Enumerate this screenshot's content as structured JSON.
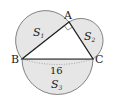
{
  "diagram": {
    "points": {
      "A": {
        "label": "A",
        "x": 69,
        "y": 22
      },
      "B": {
        "label": "B",
        "x": 22,
        "y": 59
      },
      "C": {
        "label": "C",
        "x": 93,
        "y": 59
      }
    },
    "regions": {
      "S1": {
        "label": "S",
        "sub": "1"
      },
      "S2": {
        "label": "S",
        "sub": "2"
      },
      "S3": {
        "label": "S",
        "sub": "3"
      }
    },
    "side_BC_length": "16",
    "right_angle_at": "A",
    "colors": {
      "fill": "#e6e6e6",
      "stroke": "#555555",
      "triangle": "#222222"
    }
  }
}
